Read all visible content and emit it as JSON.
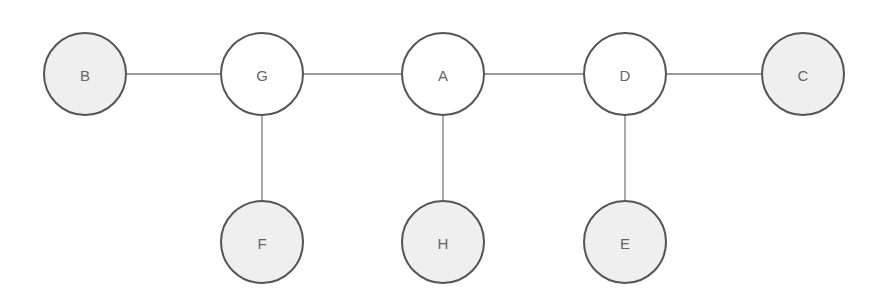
{
  "diagram": {
    "type": "tree",
    "nodes": [
      {
        "id": "B",
        "label": "B",
        "x": 85,
        "y": 74,
        "shaded": true
      },
      {
        "id": "G",
        "label": "G",
        "x": 262,
        "y": 74,
        "shaded": false
      },
      {
        "id": "A",
        "label": "A",
        "x": 443,
        "y": 74,
        "shaded": false
      },
      {
        "id": "D",
        "label": "D",
        "x": 625,
        "y": 74,
        "shaded": false
      },
      {
        "id": "C",
        "label": "C",
        "x": 803,
        "y": 74,
        "shaded": true
      },
      {
        "id": "F",
        "label": "F",
        "x": 262,
        "y": 242,
        "shaded": true
      },
      {
        "id": "H",
        "label": "H",
        "x": 443,
        "y": 242,
        "shaded": true
      },
      {
        "id": "E",
        "label": "E",
        "x": 625,
        "y": 242,
        "shaded": true
      }
    ],
    "edges": [
      [
        "B",
        "G"
      ],
      [
        "G",
        "A"
      ],
      [
        "A",
        "D"
      ],
      [
        "D",
        "C"
      ],
      [
        "G",
        "F"
      ],
      [
        "A",
        "H"
      ],
      [
        "D",
        "E"
      ]
    ],
    "colors": {
      "shaded_fill": "#efefef",
      "unshaded_fill": "#ffffff",
      "stroke": "#555555",
      "edge": "#7a7a7a",
      "label": "#666666"
    },
    "node_radius": 41
  }
}
